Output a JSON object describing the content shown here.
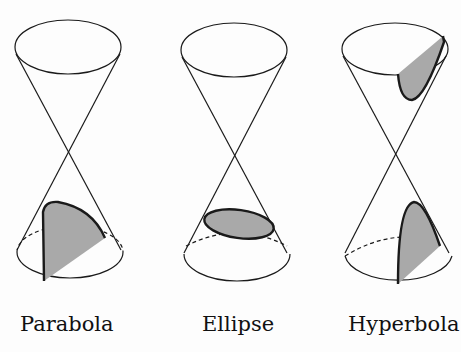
{
  "figure": {
    "panels": [
      {
        "id": "parabola",
        "label": "Parabola"
      },
      {
        "id": "ellipse",
        "label": "Ellipse"
      },
      {
        "id": "hyperbola",
        "label": "Hyperbola"
      }
    ],
    "colors": {
      "stroke": "#1a1a1a",
      "fill": "#a9a9a9",
      "background": "#fdfdfd"
    }
  }
}
